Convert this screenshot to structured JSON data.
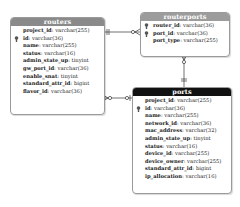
{
  "diagram": {
    "type": "entity-relationship",
    "entities": [
      {
        "name": "routers",
        "header_color": "#8a8a8a",
        "fields": [
          {
            "name": "project_id",
            "type": "varchar(255)",
            "key": false
          },
          {
            "name": "id",
            "type": "varchar(36)",
            "key": true
          },
          {
            "name": "name",
            "type": "varchar(255)",
            "key": false
          },
          {
            "name": "status",
            "type": "varchar(16)",
            "key": false
          },
          {
            "name": "admin_state_up",
            "type": "tinyint",
            "key": false
          },
          {
            "name": "gw_port_id",
            "type": "varchar(36)",
            "key": false
          },
          {
            "name": "enable_snat",
            "type": "tinyint",
            "key": false
          },
          {
            "name": "standard_attr_id",
            "type": "bigint",
            "key": false
          },
          {
            "name": "flavor_id",
            "type": "varchar(36)",
            "key": false
          }
        ]
      },
      {
        "name": "routerports",
        "header_color": "#9c9c9c",
        "fields": [
          {
            "name": "router_id",
            "type": "varchar(36)",
            "key": true
          },
          {
            "name": "port_id",
            "type": "varchar(36)",
            "key": true
          },
          {
            "name": "port_type",
            "type": "varchar(255)",
            "key": false
          }
        ]
      },
      {
        "name": "ports",
        "header_color": "#111111",
        "fields": [
          {
            "name": "project_id",
            "type": "varchar(255)",
            "key": false
          },
          {
            "name": "id",
            "type": "varchar(36)",
            "key": true
          },
          {
            "name": "name",
            "type": "varchar(255)",
            "key": false
          },
          {
            "name": "network_id",
            "type": "varchar(36)",
            "key": false
          },
          {
            "name": "mac_address",
            "type": "varchar(32)",
            "key": false
          },
          {
            "name": "admin_state_up",
            "type": "tinyint",
            "key": false
          },
          {
            "name": "status",
            "type": "varchar(16)",
            "key": false
          },
          {
            "name": "device_id",
            "type": "varchar(255)",
            "key": false
          },
          {
            "name": "device_owner",
            "type": "varchar(255)",
            "key": false
          },
          {
            "name": "standard_attr_id",
            "type": "bigint",
            "key": false
          },
          {
            "name": "ip_allocation",
            "type": "varchar(16)",
            "key": false
          }
        ]
      }
    ],
    "relationships": [
      {
        "from": "routers",
        "to": "routerports",
        "from_cardinality": "one-and-only-one",
        "to_cardinality": "zero-or-many"
      },
      {
        "from": "routers",
        "to": "ports",
        "from_cardinality": "zero-or-many",
        "to_cardinality": "zero-or-one"
      },
      {
        "from": "routerports",
        "to": "ports",
        "from_cardinality": "zero-or-many",
        "to_cardinality": "one-and-only-one"
      }
    ]
  }
}
